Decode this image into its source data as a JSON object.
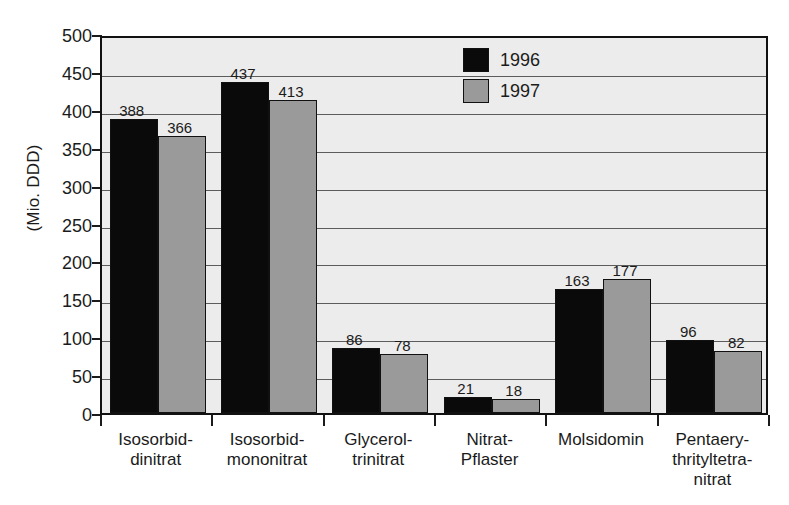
{
  "chart_data": {
    "type": "bar",
    "title": "",
    "subtitle": "",
    "xlabel": "",
    "ylabel": "(Mio. DDD)",
    "ylim": [
      0,
      500
    ],
    "ytick_step": 50,
    "yticks": [
      "500",
      "450",
      "400",
      "350",
      "300",
      "250",
      "200",
      "150",
      "100",
      "50",
      "0"
    ],
    "grid": true,
    "legend_position": "top-center-right",
    "categories": [
      "Isosorbid-\ndinitrat",
      "Isosorbid-\nmononitrat",
      "Glycerol-\ntrinitrat",
      "Nitrat-\nPflaster",
      "Molsidomin",
      "Pentaery-\nthrityltetra-\nnitrat"
    ],
    "series": [
      {
        "name": "1996",
        "color": "#0a0a0a",
        "values": [
          388,
          437,
          86,
          21,
          163,
          96
        ]
      },
      {
        "name": "1997",
        "color": "#9a9a9a",
        "values": [
          366,
          413,
          78,
          18,
          177,
          82
        ]
      }
    ]
  },
  "colors": {
    "series_1996": "#0a0a0a",
    "series_1997": "#9a9a9a",
    "plot_background": "#ececec",
    "axis": "#111111",
    "gridline": "#5c5c5c",
    "text": "#1b1b1b",
    "page_background": "#ffffff"
  }
}
